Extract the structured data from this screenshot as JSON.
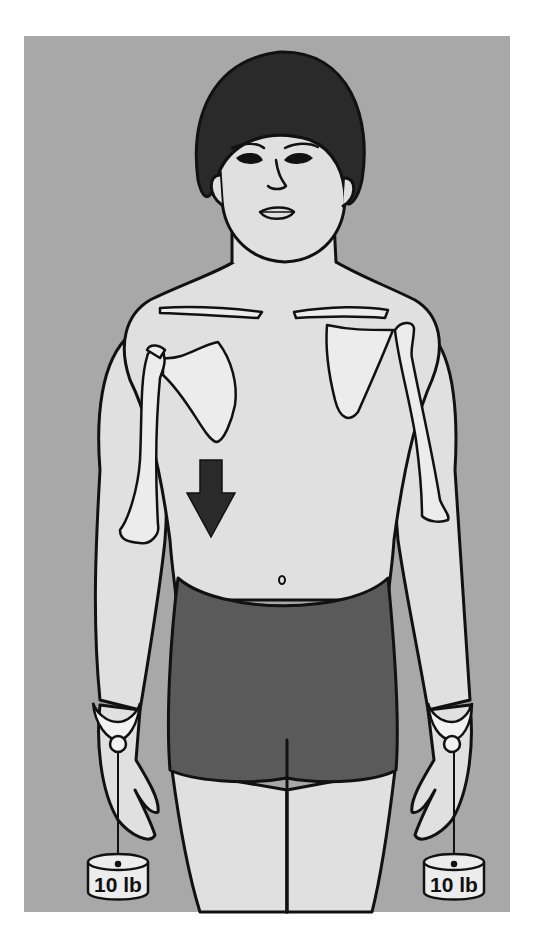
{
  "illustration": {
    "subject": "anterior view of standing figure with skeletal overlay of clavicles, scapulae and humeri",
    "colors": {
      "background": "#a8a8a8",
      "page": "#ffffff",
      "skin": "#e0e0e0",
      "bone": "#ececec",
      "hair": "#2a2a2a",
      "shorts": "#5a5a5a",
      "outline": "#111111",
      "arrow": "#2a2a2a"
    },
    "arrow": {
      "direction": "down",
      "icon": "arrow-down-icon"
    },
    "weights": [
      {
        "side": "right-hand",
        "label": "10 lb"
      },
      {
        "side": "left-hand",
        "label": "10 lb"
      }
    ]
  }
}
